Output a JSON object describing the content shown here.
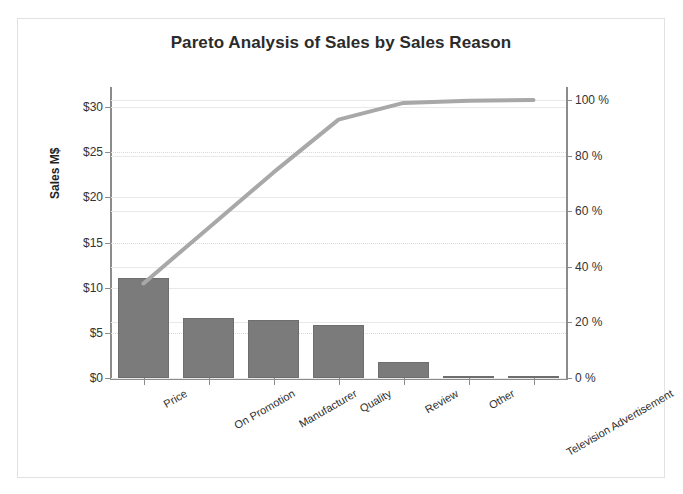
{
  "chart_data": {
    "type": "bar",
    "title": "Pareto Analysis of Sales by Sales Reason",
    "xlabel": "",
    "ylabel": "Sales M$",
    "y2label": "",
    "categories": [
      "Price",
      "On Promotion",
      "Manufacturer",
      "Quality",
      "Review",
      "Other",
      "Television Advertisement"
    ],
    "series": [
      {
        "name": "Sales M$",
        "type": "bar",
        "axis": "left",
        "values": [
          11.1,
          6.6,
          6.4,
          5.9,
          1.8,
          0.1,
          0.05
        ]
      },
      {
        "name": "Cumulative %",
        "type": "line",
        "axis": "right",
        "values": [
          34.0,
          54.0,
          74.0,
          93.0,
          99.0,
          99.8,
          100.0
        ]
      }
    ],
    "ylim": [
      0,
      32
    ],
    "y2lim": [
      0,
      104
    ],
    "yticks": [
      0,
      5,
      10,
      15,
      20,
      25,
      30
    ],
    "ytick_labels": [
      "$0",
      "$5",
      "$10",
      "$15",
      "$20",
      "$25",
      "$30"
    ],
    "y2ticks": [
      0,
      20,
      40,
      60,
      80,
      100
    ],
    "y2tick_labels": [
      "0 %",
      "20 %",
      "40 %",
      "60 %",
      "80 %",
      "100 %"
    ],
    "grid": true,
    "legend": "none",
    "bar_color": "#7b7b7b",
    "line_color": "#a8a8a8",
    "frame_color": "#e2e2e2",
    "axis_color": "#8c8c8c",
    "grid_color": "#e9e9e9"
  }
}
